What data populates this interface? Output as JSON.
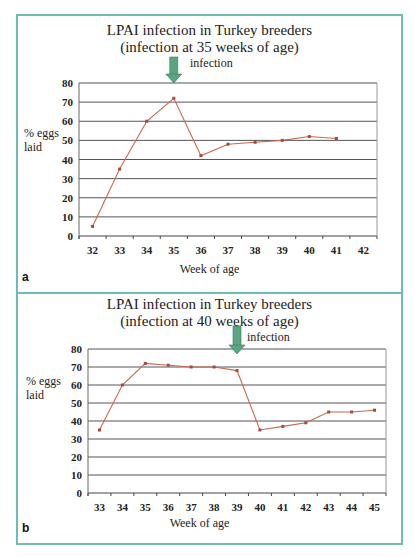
{
  "chart_data": [
    {
      "type": "line",
      "panel": "a",
      "title": "LPAI infection in Turkey breeders",
      "subtitle": "(infection at 35 weeks of age)",
      "xlabel": "Week of age",
      "ylabel": "% eggs laid",
      "categories": [
        "32",
        "33",
        "34",
        "35",
        "36",
        "37",
        "38",
        "39",
        "40",
        "41",
        "42"
      ],
      "series": [
        {
          "name": "% eggs laid",
          "values": [
            5,
            35,
            60,
            72,
            42,
            48,
            49,
            50,
            52,
            51,
            null
          ]
        }
      ],
      "ylim": [
        0,
        80
      ],
      "yticks": [
        0,
        10,
        20,
        30,
        40,
        50,
        60,
        70,
        80
      ],
      "grid": true,
      "annotation": {
        "label": "infection",
        "x": "35",
        "color": "#5aa57f"
      },
      "line_color": "#c9694f"
    },
    {
      "type": "line",
      "panel": "b",
      "title": "LPAI infection in Turkey breeders",
      "subtitle": "(infection at 40 weeks of age)",
      "xlabel": "Week of age",
      "ylabel": "% eggs laid",
      "categories": [
        "33",
        "34",
        "35",
        "36",
        "37",
        "38",
        "39",
        "40",
        "41",
        "42",
        "43",
        "44",
        "45"
      ],
      "series": [
        {
          "name": "% eggs laid",
          "values": [
            35,
            60,
            72,
            71,
            70,
            70,
            68,
            35,
            37,
            39,
            45,
            45,
            46
          ]
        }
      ],
      "ylim": [
        0,
        80
      ],
      "yticks": [
        0,
        10,
        20,
        30,
        40,
        50,
        60,
        70,
        80
      ],
      "grid": true,
      "annotation": {
        "label": "infection",
        "x": "39",
        "color": "#5aa57f"
      },
      "line_color": "#c9694f"
    }
  ],
  "panels": {
    "a": {
      "letter": "a",
      "title": "LPAI infection in Turkey breeders",
      "subtitle": "(infection at 35 weeks of age)",
      "ylabel_1": "% eggs",
      "ylabel_2": "laid",
      "xlabel": "Week of age",
      "infection_label": "infection"
    },
    "b": {
      "letter": "b",
      "title": "LPAI infection in Turkey breeders",
      "subtitle": "(infection at 40 weeks of age)",
      "ylabel_1": "% eggs",
      "ylabel_2": "laid",
      "xlabel": "Week of age",
      "infection_label": "infection"
    }
  },
  "colors": {
    "border": "#6bbdb6",
    "line": "#c9694f",
    "arrow": "#5aa57f",
    "grid": "#555555"
  }
}
